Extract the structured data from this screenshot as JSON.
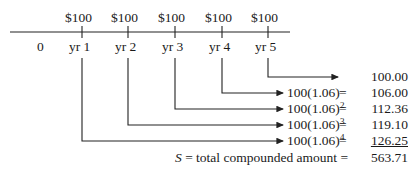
{
  "timeline": {
    "payments": [
      "$100",
      "$100",
      "$100",
      "$100",
      "$100"
    ],
    "start_label": "0",
    "years": [
      "yr 1",
      "yr 2",
      "yr 3",
      "yr 4",
      "yr 5"
    ]
  },
  "rows": [
    {
      "from": "yr 5",
      "base": "",
      "exponent": "",
      "equals": "",
      "value": "100.00",
      "underline": false
    },
    {
      "from": "yr 4",
      "base": "100(1.06)",
      "exponent": "",
      "equals": "=",
      "value": "106.00",
      "underline": false
    },
    {
      "from": "yr 3",
      "base": "100(1.06)",
      "exponent": "2",
      "equals": "=",
      "value": "112.36",
      "underline": false
    },
    {
      "from": "yr 2",
      "base": "100(1.06)",
      "exponent": "3",
      "equals": "=",
      "value": "119.10",
      "underline": false
    },
    {
      "from": "yr 1",
      "base": "100(1.06)",
      "exponent": "4",
      "equals": "=",
      "value": "126.25",
      "underline": true
    }
  ],
  "total": {
    "symbol": "S",
    "label": "= total compounded amount =",
    "value": "563.71"
  }
}
